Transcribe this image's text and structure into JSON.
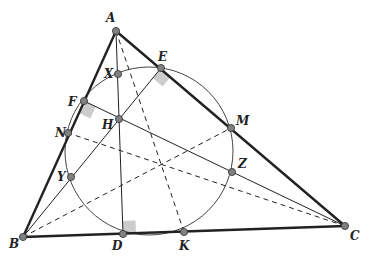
{
  "diagram": {
    "colors": {
      "stroke": "#222222",
      "point_fill": "#808080",
      "right_angle": "#cccccc",
      "circle": "#444444"
    },
    "points": {
      "A": {
        "x": 116,
        "y": 31,
        "label": "A",
        "lx": 106,
        "ly": 22
      },
      "B": {
        "x": 23,
        "y": 237,
        "label": "B",
        "lx": 9,
        "ly": 248
      },
      "C": {
        "x": 345,
        "y": 226,
        "label": "C",
        "lx": 350,
        "ly": 240
      },
      "D": {
        "x": 123,
        "y": 234,
        "label": "D",
        "lx": 112,
        "ly": 250
      },
      "E": {
        "x": 161,
        "y": 68,
        "label": "E",
        "lx": 158,
        "ly": 61
      },
      "F": {
        "x": 84,
        "y": 101,
        "label": "F",
        "lx": 68,
        "ly": 106
      },
      "H": {
        "x": 119,
        "y": 119,
        "label": "H",
        "lx": 102,
        "ly": 129
      },
      "K": {
        "x": 184,
        "y": 232,
        "label": "K",
        "lx": 179,
        "ly": 250
      },
      "M": {
        "x": 231,
        "y": 128,
        "label": "M",
        "lx": 236,
        "ly": 125
      },
      "N": {
        "x": 68,
        "y": 133,
        "label": "N",
        "lx": 55,
        "ly": 137
      },
      "X": {
        "x": 118,
        "y": 74,
        "label": "X",
        "lx": 104,
        "ly": 78
      },
      "Y": {
        "x": 71,
        "y": 177,
        "label": "Y",
        "lx": 57,
        "ly": 181
      },
      "Z": {
        "x": 232,
        "y": 172,
        "label": "Z",
        "lx": 238,
        "ly": 168
      }
    },
    "circle": {
      "cx": 149,
      "cy": 151,
      "r": 84
    }
  }
}
